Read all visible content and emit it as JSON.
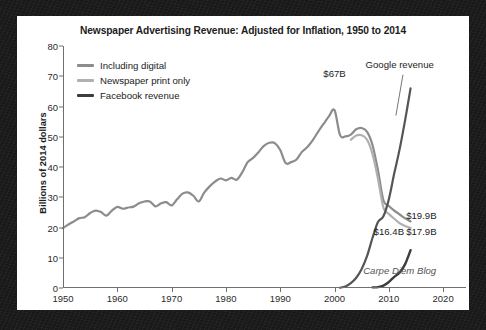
{
  "chart_data": {
    "type": "line",
    "title": "Newspaper Advertising Revenue: Adjusted for Inflation, 1950 to 2014",
    "xlabel": "",
    "ylabel": "Billions of 2014 dollars",
    "xlim": [
      1950,
      2022
    ],
    "ylim": [
      0,
      80
    ],
    "grid": false,
    "legend_position": "top-left-inside",
    "x_ticks": [
      1950,
      1960,
      1970,
      1980,
      1990,
      2000,
      2010,
      2020
    ],
    "y_ticks": [
      0,
      10,
      20,
      30,
      40,
      50,
      60,
      70,
      80
    ],
    "colors": {
      "including_digital": "#8c8c8c",
      "newspaper_print_only": "#b0b0b0",
      "facebook_revenue": "#3d3d3d",
      "google_revenue": "#555555",
      "axis": "#6f6f6f",
      "text": "#1c1c1c",
      "card_background": "#ffffff",
      "frame_background": "#191919"
    },
    "series": [
      {
        "name": "Including digital",
        "color": "#8c8c8c",
        "x": [
          1950,
          1951,
          1952,
          1953,
          1954,
          1955,
          1956,
          1957,
          1958,
          1959,
          1960,
          1961,
          1962,
          1963,
          1964,
          1965,
          1966,
          1967,
          1968,
          1969,
          1970,
          1971,
          1972,
          1973,
          1974,
          1975,
          1976,
          1977,
          1978,
          1979,
          1980,
          1981,
          1982,
          1983,
          1984,
          1985,
          1986,
          1987,
          1988,
          1989,
          1990,
          1991,
          1992,
          1993,
          1994,
          1995,
          1996,
          1997,
          1998,
          1999,
          2000,
          2001,
          2002,
          2003,
          2004,
          2005,
          2006,
          2007,
          2008,
          2009,
          2010,
          2011,
          2012,
          2013,
          2014
        ],
        "values": [
          19.8,
          21.0,
          22.0,
          23.1,
          23.4,
          24.8,
          25.6,
          25.1,
          23.9,
          25.6,
          26.8,
          26.2,
          26.6,
          26.9,
          28.0,
          28.6,
          28.6,
          27.0,
          27.9,
          28.4,
          27.3,
          29.3,
          31.2,
          31.6,
          30.5,
          28.6,
          31.5,
          33.6,
          35.2,
          36.2,
          35.6,
          36.4,
          35.8,
          38.2,
          41.6,
          43.0,
          44.9,
          47.0,
          48.0,
          47.9,
          45.6,
          41.3,
          41.6,
          42.5,
          45.0,
          46.6,
          48.9,
          51.7,
          54.3,
          56.8,
          58.8,
          50.6,
          50.1,
          50.7,
          52.5,
          52.9,
          51.6,
          47.2,
          38.9,
          29.0,
          27.1,
          25.6,
          24.3,
          23.0,
          22.0
        ]
      },
      {
        "name": "Newspaper print only",
        "color": "#b0b0b0",
        "x": [
          2003,
          2004,
          2005,
          2006,
          2007,
          2008,
          2009,
          2010,
          2011,
          2012,
          2013,
          2014
        ],
        "values": [
          49.0,
          50.4,
          50.5,
          49.0,
          44.2,
          36.1,
          26.6,
          24.5,
          22.9,
          21.4,
          20.5,
          19.9
        ]
      },
      {
        "name": "Google revenue",
        "color": "#555555",
        "x": [
          2001,
          2002,
          2003,
          2004,
          2005,
          2006,
          2007,
          2008,
          2009,
          2010,
          2011,
          2012,
          2013,
          2014
        ],
        "values": [
          0.1,
          0.5,
          1.6,
          3.4,
          6.3,
          10.6,
          16.6,
          21.8,
          23.7,
          29.3,
          37.9,
          46.0,
          55.5,
          66.0
        ]
      },
      {
        "name": "Facebook revenue",
        "color": "#3d3d3d",
        "x": [
          2007,
          2008,
          2009,
          2010,
          2011,
          2012,
          2013,
          2014
        ],
        "values": [
          0.2,
          0.3,
          0.8,
          2.0,
          3.7,
          5.1,
          7.9,
          12.5
        ]
      }
    ],
    "annotations": [
      {
        "id": "peak-label",
        "text": "$67B",
        "x": 2000,
        "y": 71
      },
      {
        "id": "google-label",
        "text": "Google revenue",
        "x": 2012,
        "y": 74
      },
      {
        "id": "print-label",
        "text": "$19.9B",
        "x": 2016,
        "y": 24
      },
      {
        "id": "digital-label",
        "text": "$17.9B",
        "x": 2016,
        "y": 19
      },
      {
        "id": "facebook-label",
        "text": "$16.4B",
        "x": 2010,
        "y": 19
      },
      {
        "id": "watermark",
        "text": "Carpe Diem Blog",
        "x": 2012,
        "y": 6
      }
    ],
    "legend": [
      {
        "label": "Including digital",
        "color": "#8c8c8c"
      },
      {
        "label": "Newspaper print only",
        "color": "#b0b0b0"
      },
      {
        "label": "Facebook revenue",
        "color": "#3d3d3d"
      }
    ]
  }
}
